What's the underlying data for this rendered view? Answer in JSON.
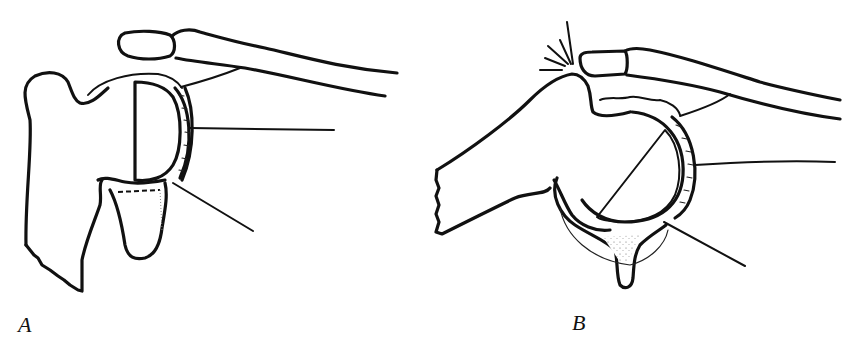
{
  "figure": {
    "type": "anatomical line drawing",
    "background": "#ffffff",
    "ink_color": "#111111"
  },
  "panels": [
    {
      "id": "A",
      "label": "A",
      "description": "Shoulder with stippled humeral head seated in glenoid, clavicle above, labeled leader lines"
    },
    {
      "id": "B",
      "label": "B",
      "description": "Shoulder in abducted position with stippled humeral head, impingement burst marks at acromion, leader lines"
    }
  ]
}
